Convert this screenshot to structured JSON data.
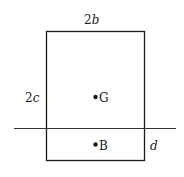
{
  "diagram": {
    "type": "floating-block-cross-section",
    "labels": {
      "width_coef": "2",
      "width_var": "b",
      "height_coef": "2",
      "height_var": "c",
      "center_of_gravity": "G",
      "center_of_buoyancy": "B",
      "draft": "d"
    },
    "geometry": {
      "rect": {
        "x": 46,
        "y": 31,
        "w": 98,
        "h": 129
      },
      "waterline": {
        "x1": 14,
        "x2": 176,
        "y": 128
      },
      "G_point": {
        "x": 95,
        "y": 97
      },
      "B_point": {
        "x": 95,
        "y": 144
      }
    },
    "colors": {
      "stroke": "#1a1a1a",
      "background": "#ffffff"
    }
  }
}
